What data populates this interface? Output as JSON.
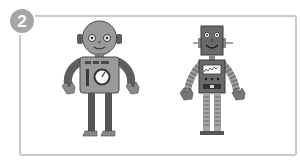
{
  "badge": {
    "number": "2"
  },
  "illustration": {
    "robots": [
      {
        "name": "round-head-robot",
        "position": "left",
        "features": [
          "round head",
          "ear bolts",
          "antenna-less dome",
          "chest gauge dial",
          "chest vent bars",
          "dark sleeves",
          "dark legs",
          "flat feet"
        ]
      },
      {
        "name": "square-head-robot",
        "position": "right",
        "features": [
          "square head",
          "side bolts",
          "smile",
          "chest meter display",
          "chest buttons",
          "striped arms",
          "striped legs"
        ]
      }
    ]
  },
  "colors": {
    "frame_border": "#c9c9c9",
    "badge_bg": "#a6a6a6",
    "robot_body_light": "#9a9a9a",
    "robot_body_dark": "#5e5e5e",
    "robot_outline": "#3a3a3a"
  }
}
